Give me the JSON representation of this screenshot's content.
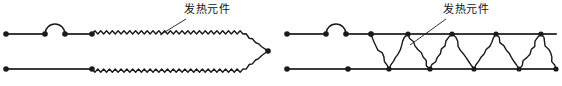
{
  "figure": {
    "width": 562,
    "height": 86,
    "background_color": "#ffffff",
    "stroke_color": "#1a1a1a",
    "rail_color": "#3a3a3a"
  },
  "diagrams": [
    {
      "id": "left-diagram",
      "name": "wavy-heating-element-diagram",
      "label": {
        "text": "发热元件",
        "x": 184,
        "y": 3,
        "leader_from": [
          186,
          19
        ],
        "leader_to": [
          160,
          35
        ]
      },
      "rails": [
        {
          "name": "upper-lead-wire",
          "x1": 6,
          "y1": 34,
          "x2": 45,
          "y2": 34
        },
        {
          "name": "upper-lead-wire-segment-2",
          "x1": 65,
          "y1": 34,
          "x2": 92,
          "y2": 34
        },
        {
          "name": "lower-lead-wire",
          "x1": 6,
          "y1": 69,
          "x2": 92,
          "y2": 69
        }
      ],
      "hop": {
        "name": "wire-hop-arc",
        "cx": 55,
        "cy": 34,
        "r": 10
      },
      "terminals": [
        {
          "name": "terminal-dot-upper-left",
          "x": 6,
          "y": 34
        },
        {
          "name": "terminal-dot-upper-hop-left",
          "x": 45,
          "y": 34
        },
        {
          "name": "terminal-dot-upper-hop-right",
          "x": 65,
          "y": 34
        },
        {
          "name": "terminal-dot-upper-element-start",
          "x": 92,
          "y": 34
        },
        {
          "name": "terminal-dot-lower-left",
          "x": 6,
          "y": 69
        },
        {
          "name": "terminal-dot-lower-element-start",
          "x": 92,
          "y": 69
        },
        {
          "name": "terminal-dot-apex",
          "x": 268,
          "y": 51
        }
      ],
      "element": {
        "type": "fine-wavy-resistance-wire",
        "start_upper": [
          92,
          34
        ],
        "start_lower": [
          92,
          69
        ],
        "apex": [
          268,
          51
        ],
        "taper_start_x": 243,
        "wave_count": 26,
        "wave_amplitude": 3.2
      }
    },
    {
      "id": "right-diagram",
      "name": "zigzag-heating-element-diagram",
      "label": {
        "text": "发热元件",
        "x": 443,
        "y": 3,
        "leader_from": [
          446,
          19
        ],
        "leader_to": [
          410,
          45
        ]
      },
      "rails": [
        {
          "name": "upper-lead-wire",
          "x1": 287,
          "y1": 34,
          "x2": 326,
          "y2": 34
        },
        {
          "name": "upper-lead-wire-segment-2",
          "x1": 346,
          "y1": 34,
          "x2": 556,
          "y2": 34
        },
        {
          "name": "lower-lead-wire",
          "x1": 287,
          "y1": 69,
          "x2": 556,
          "y2": 69
        }
      ],
      "hop": {
        "name": "wire-hop-arc",
        "cx": 336,
        "cy": 34,
        "r": 10
      },
      "terminals": [
        {
          "name": "terminal-dot-upper-left",
          "x": 287,
          "y": 34
        },
        {
          "name": "terminal-dot-upper-hop-left",
          "x": 326,
          "y": 34
        },
        {
          "name": "terminal-dot-upper-hop-right",
          "x": 346,
          "y": 34
        },
        {
          "name": "terminal-dot-upper-element-start",
          "x": 371,
          "y": 34
        },
        {
          "name": "terminal-dot-lower-left",
          "x": 287,
          "y": 69
        },
        {
          "name": "terminal-dot-lower-element-start",
          "x": 348,
          "y": 69
        }
      ],
      "element": {
        "type": "triangular-zigzag-resistance-wire",
        "start": [
          371,
          34
        ],
        "upper_vertices_x": [
          371,
          408,
          452,
          496,
          541
        ],
        "lower_vertices_x": [
          389,
          430,
          474,
          519,
          556
        ],
        "upper_y": 34,
        "lower_y": 69,
        "jitter_amplitude": 1.6
      }
    }
  ]
}
